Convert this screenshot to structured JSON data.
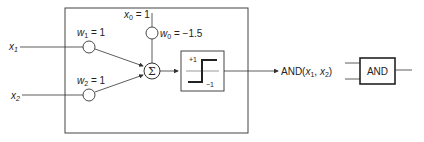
{
  "diagram": {
    "inputs": [
      {
        "id": "x1",
        "label": "x",
        "sub": "1"
      },
      {
        "id": "x2",
        "label": "x",
        "sub": "2"
      }
    ],
    "bias": {
      "label": "x",
      "sub": "0",
      "value": " = 1"
    },
    "weights": [
      {
        "id": "w1",
        "label": "w",
        "sub": "1",
        "value": " = 1"
      },
      {
        "id": "w2",
        "label": "w",
        "sub": "2",
        "value": " = 1"
      },
      {
        "id": "w0",
        "label": "w",
        "sub": "0",
        "value": " = −1.5"
      }
    ],
    "summation": {
      "symbol": "Σ"
    },
    "activation": {
      "upper": "+1",
      "lower": "−1"
    },
    "output": {
      "prefix": "AND(",
      "x1": "x",
      "x1_sub": "1",
      "sep": ", ",
      "x2": "x",
      "x2_sub": "2",
      "suffix": ")"
    },
    "gate": {
      "label": "AND"
    },
    "colors": {
      "line": "#333333",
      "box": "#444444",
      "fill": "#ffffff"
    }
  }
}
